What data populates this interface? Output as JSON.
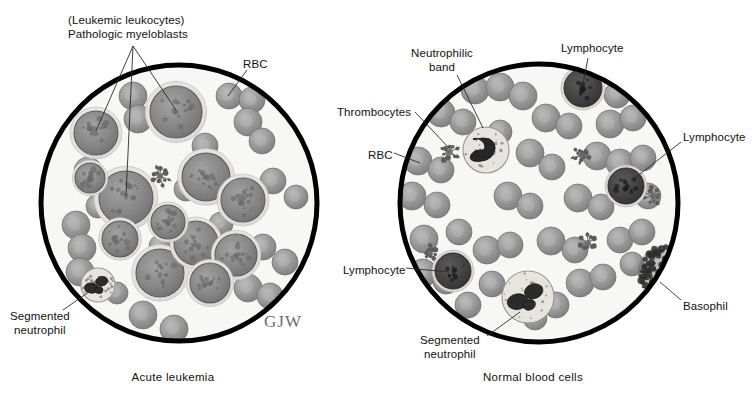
{
  "figure": {
    "title_alt": "Blood smear comparison: acute leukemia versus normal blood cells",
    "signature": "GJW",
    "colors": {
      "field": "#f7f7f5",
      "border": "#000000",
      "rbc": "#9a9a9a",
      "rbc_dark": "#7c7c7c",
      "blast_nucleus": "#8a8a8a",
      "cytoplasm": "#e6e6e2",
      "lymphocyte": "#4a4a4a",
      "basophil": "#3a3a3a",
      "leader_line": "#2b2b2b",
      "text": "#111111"
    }
  },
  "panels": [
    {
      "id": "left",
      "caption": "Acute leukemia",
      "circle": {
        "cx": 179,
        "cy": 203,
        "r": 138
      },
      "labels": [
        {
          "name": "pathologic-myeloblasts",
          "lines": [
            "(Leukemic leukocytes)",
            "Pathologic myeloblasts"
          ],
          "x": 68,
          "y": 14,
          "align": "left"
        },
        {
          "name": "rbc",
          "lines": [
            "RBC"
          ],
          "x": 243,
          "y": 58,
          "align": "left"
        },
        {
          "name": "segmented-neutrophil",
          "lines": [
            "Segmented",
            "neutrophil"
          ],
          "x": 10,
          "y": 310,
          "align": "left"
        }
      ]
    },
    {
      "id": "right",
      "caption": "Normal blood cells",
      "circle": {
        "cx": 539,
        "cy": 203,
        "r": 139
      },
      "labels": [
        {
          "name": "neutrophilic-band",
          "lines": [
            "Neutrophilic",
            "band"
          ],
          "x": 411,
          "y": 47,
          "align": "left"
        },
        {
          "name": "lymphocyte-top",
          "lines": [
            "Lymphocyte"
          ],
          "x": 561,
          "y": 42,
          "align": "left"
        },
        {
          "name": "thrombocytes",
          "lines": [
            "Thrombocytes"
          ],
          "x": 337,
          "y": 106,
          "align": "left"
        },
        {
          "name": "rbc",
          "lines": [
            "RBC"
          ],
          "x": 368,
          "y": 149,
          "align": "left"
        },
        {
          "name": "lymphocyte-right",
          "lines": [
            "Lymphocyte"
          ],
          "x": 683,
          "y": 131,
          "align": "left"
        },
        {
          "name": "lymphocyte-left",
          "lines": [
            "Lymphocyte"
          ],
          "x": 343,
          "y": 264,
          "align": "left"
        },
        {
          "name": "basophil",
          "lines": [
            "Basophil"
          ],
          "x": 683,
          "y": 300,
          "align": "left"
        },
        {
          "name": "segmented-neutrophil",
          "lines": [
            "Segmented",
            "neutrophil"
          ],
          "x": 420,
          "y": 334,
          "align": "left"
        }
      ]
    }
  ],
  "captions": [
    {
      "name": "caption-acute-leukemia",
      "text": "Acute leukemia",
      "x": 173,
      "y": 371
    },
    {
      "name": "caption-normal-blood-cells",
      "text": "Normal blood cells",
      "x": 533,
      "y": 371
    }
  ],
  "leader_lines": [
    {
      "name": "leader-myeloblast-1",
      "x1": 133,
      "y1": 46,
      "x2": 96,
      "y2": 131
    },
    {
      "name": "leader-myeloblast-2",
      "x1": 133,
      "y1": 46,
      "x2": 126,
      "y2": 196
    },
    {
      "name": "leader-myeloblast-3",
      "x1": 133,
      "y1": 46,
      "x2": 176,
      "y2": 110
    },
    {
      "name": "leader-rbc-left",
      "x1": 247,
      "y1": 70,
      "x2": 228,
      "y2": 96
    },
    {
      "name": "leader-seg-neut-left",
      "x1": 63,
      "y1": 310,
      "x2": 96,
      "y2": 287
    },
    {
      "name": "leader-neut-band",
      "x1": 457,
      "y1": 75,
      "x2": 483,
      "y2": 128
    },
    {
      "name": "leader-lymph-top",
      "x1": 588,
      "y1": 58,
      "x2": 583,
      "y2": 84
    },
    {
      "name": "leader-thrombo",
      "x1": 415,
      "y1": 112,
      "x2": 449,
      "y2": 148
    },
    {
      "name": "leader-rbc-right",
      "x1": 394,
      "y1": 153,
      "x2": 420,
      "y2": 163
    },
    {
      "name": "leader-lymph-right",
      "x1": 681,
      "y1": 142,
      "x2": 631,
      "y2": 181
    },
    {
      "name": "leader-lymph-left",
      "x1": 406,
      "y1": 268,
      "x2": 449,
      "y2": 272
    },
    {
      "name": "leader-basophil",
      "x1": 681,
      "y1": 300,
      "x2": 660,
      "y2": 282
    },
    {
      "name": "leader-seg-neut-right",
      "x1": 487,
      "y1": 336,
      "x2": 520,
      "y2": 312
    }
  ],
  "cells": {
    "left": {
      "rbcs": [
        {
          "cx": 133,
          "cy": 96,
          "r": 14
        },
        {
          "cx": 138,
          "cy": 119,
          "r": 14
        },
        {
          "cx": 205,
          "cy": 146,
          "r": 13
        },
        {
          "cx": 229,
          "cy": 96,
          "r": 13
        },
        {
          "cx": 252,
          "cy": 100,
          "r": 13
        },
        {
          "cx": 248,
          "cy": 122,
          "r": 14
        },
        {
          "cx": 262,
          "cy": 141,
          "r": 13
        },
        {
          "cx": 88,
          "cy": 171,
          "r": 14
        },
        {
          "cx": 186,
          "cy": 189,
          "r": 12
        },
        {
          "cx": 273,
          "cy": 181,
          "r": 13
        },
        {
          "cx": 296,
          "cy": 197,
          "r": 12
        },
        {
          "cx": 76,
          "cy": 225,
          "r": 14
        },
        {
          "cx": 82,
          "cy": 248,
          "r": 14
        },
        {
          "cx": 80,
          "cy": 272,
          "r": 14
        },
        {
          "cx": 263,
          "cy": 247,
          "r": 13
        },
        {
          "cx": 285,
          "cy": 262,
          "r": 13
        },
        {
          "cx": 248,
          "cy": 288,
          "r": 14
        },
        {
          "cx": 270,
          "cy": 296,
          "r": 13
        },
        {
          "cx": 143,
          "cy": 315,
          "r": 14
        },
        {
          "cx": 174,
          "cy": 329,
          "r": 14
        },
        {
          "cx": 117,
          "cy": 293,
          "r": 11
        },
        {
          "cx": 221,
          "cy": 224,
          "r": 12
        },
        {
          "cx": 98,
          "cy": 206,
          "r": 12
        },
        {
          "cx": 160,
          "cy": 246,
          "r": 11
        }
      ],
      "blasts": [
        {
          "cx": 96,
          "cy": 133,
          "r": 22
        },
        {
          "cx": 176,
          "cy": 112,
          "r": 26
        },
        {
          "cx": 126,
          "cy": 198,
          "r": 27
        },
        {
          "cx": 206,
          "cy": 177,
          "r": 24
        },
        {
          "cx": 243,
          "cy": 200,
          "r": 22
        },
        {
          "cx": 160,
          "cy": 273,
          "r": 24
        },
        {
          "cx": 196,
          "cy": 243,
          "r": 22
        },
        {
          "cx": 236,
          "cy": 255,
          "r": 21
        },
        {
          "cx": 120,
          "cy": 239,
          "r": 18
        },
        {
          "cx": 168,
          "cy": 222,
          "r": 17
        },
        {
          "cx": 210,
          "cy": 283,
          "r": 20
        },
        {
          "cx": 90,
          "cy": 178,
          "r": 15
        }
      ],
      "neutrophils": [
        {
          "cx": 98,
          "cy": 285,
          "r": 17
        }
      ],
      "thrombocytes": [
        {
          "cx": 160,
          "cy": 176,
          "r": 9
        }
      ]
    },
    "right": {
      "rbcs": [
        {
          "cx": 475,
          "cy": 90,
          "r": 14
        },
        {
          "cx": 500,
          "cy": 87,
          "r": 14
        },
        {
          "cx": 523,
          "cy": 96,
          "r": 14
        },
        {
          "cx": 617,
          "cy": 95,
          "r": 13
        },
        {
          "cx": 441,
          "cy": 113,
          "r": 14
        },
        {
          "cx": 463,
          "cy": 122,
          "r": 13
        },
        {
          "cx": 546,
          "cy": 118,
          "r": 14
        },
        {
          "cx": 569,
          "cy": 126,
          "r": 13
        },
        {
          "cx": 610,
          "cy": 124,
          "r": 14
        },
        {
          "cx": 633,
          "cy": 118,
          "r": 13
        },
        {
          "cx": 418,
          "cy": 161,
          "r": 14
        },
        {
          "cx": 441,
          "cy": 170,
          "r": 13
        },
        {
          "cx": 530,
          "cy": 153,
          "r": 14
        },
        {
          "cx": 552,
          "cy": 167,
          "r": 13
        },
        {
          "cx": 597,
          "cy": 156,
          "r": 14
        },
        {
          "cx": 620,
          "cy": 163,
          "r": 14
        },
        {
          "cx": 643,
          "cy": 158,
          "r": 13
        },
        {
          "cx": 412,
          "cy": 196,
          "r": 14
        },
        {
          "cx": 437,
          "cy": 205,
          "r": 13
        },
        {
          "cx": 508,
          "cy": 196,
          "r": 14
        },
        {
          "cx": 530,
          "cy": 206,
          "r": 13
        },
        {
          "cx": 578,
          "cy": 198,
          "r": 14
        },
        {
          "cx": 601,
          "cy": 207,
          "r": 13
        },
        {
          "cx": 648,
          "cy": 196,
          "r": 13
        },
        {
          "cx": 424,
          "cy": 239,
          "r": 14
        },
        {
          "cx": 459,
          "cy": 232,
          "r": 13
        },
        {
          "cx": 487,
          "cy": 250,
          "r": 14
        },
        {
          "cx": 510,
          "cy": 245,
          "r": 13
        },
        {
          "cx": 551,
          "cy": 241,
          "r": 14
        },
        {
          "cx": 575,
          "cy": 250,
          "r": 13
        },
        {
          "cx": 620,
          "cy": 240,
          "r": 13
        },
        {
          "cx": 642,
          "cy": 232,
          "r": 13
        },
        {
          "cx": 423,
          "cy": 273,
          "r": 14
        },
        {
          "cx": 446,
          "cy": 281,
          "r": 13
        },
        {
          "cx": 492,
          "cy": 284,
          "r": 13
        },
        {
          "cx": 580,
          "cy": 283,
          "r": 14
        },
        {
          "cx": 603,
          "cy": 277,
          "r": 13
        },
        {
          "cx": 468,
          "cy": 305,
          "r": 13
        },
        {
          "cx": 556,
          "cy": 305,
          "r": 13
        },
        {
          "cx": 535,
          "cy": 318,
          "r": 12
        },
        {
          "cx": 632,
          "cy": 264,
          "r": 12
        },
        {
          "cx": 500,
          "cy": 132,
          "r": 12
        }
      ],
      "neutrophils": [
        {
          "cx": 486,
          "cy": 150,
          "r": 23,
          "kind": "band"
        },
        {
          "cx": 528,
          "cy": 297,
          "r": 26,
          "kind": "segmented"
        }
      ],
      "lymphocytes": [
        {
          "cx": 583,
          "cy": 88,
          "r": 19
        },
        {
          "cx": 626,
          "cy": 186,
          "r": 18
        },
        {
          "cx": 453,
          "cy": 271,
          "r": 18
        }
      ],
      "thrombocytes": [
        {
          "cx": 449,
          "cy": 152,
          "r": 11
        },
        {
          "cx": 581,
          "cy": 155,
          "r": 8
        },
        {
          "cx": 588,
          "cy": 243,
          "r": 9
        },
        {
          "cx": 653,
          "cy": 196,
          "r": 8
        },
        {
          "cx": 430,
          "cy": 253,
          "r": 7
        }
      ],
      "basophil": {
        "cx": 664,
        "cy": 272,
        "r": 26
      }
    }
  }
}
